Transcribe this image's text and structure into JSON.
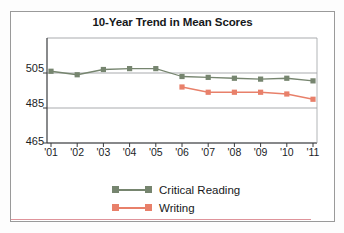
{
  "chart_data": {
    "type": "line",
    "title": "10-Year Trend in Mean Scores",
    "xlabel": "",
    "ylabel": "",
    "categories": [
      "'01",
      "'02",
      "'03",
      "'04",
      "'05",
      "'06",
      "'07",
      "'08",
      "'09",
      "'10",
      "'11"
    ],
    "ylim": [
      465,
      525
    ],
    "yticks": [
      465,
      485,
      505
    ],
    "ytick_labels": [
      "465",
      "485",
      "505"
    ],
    "grid": true,
    "legend_position": "bottom-center",
    "series": [
      {
        "name": "Critical Reading",
        "color": "#76856f",
        "marker": "square",
        "values": [
          506,
          504,
          507,
          507.5,
          507.5,
          503,
          502.5,
          502,
          501.5,
          502,
          500.5
        ]
      },
      {
        "name": "Writing",
        "color": "#e8806a",
        "marker": "square",
        "values": [
          null,
          null,
          null,
          null,
          null,
          497,
          494,
          494,
          494,
          493,
          490
        ]
      }
    ]
  },
  "chart": {
    "title": "10-Year Trend in Mean Scores",
    "ytick_labels": [
      "505",
      "485",
      "465"
    ],
    "xtick_labels": [
      "'01",
      "'02",
      "'03",
      "'04",
      "'05",
      "'06",
      "'07",
      "'08",
      "'09",
      "'10",
      "'11"
    ],
    "legend": [
      {
        "label": "Critical Reading",
        "color": "#76856f"
      },
      {
        "label": "Writing",
        "color": "#e8806a"
      }
    ],
    "colors": {
      "critical_reading": "#76856f",
      "writing": "#e8806a",
      "axis": "#3a3c3e",
      "grid": "#9fa2a5",
      "frame": "#9a9a9a"
    }
  }
}
